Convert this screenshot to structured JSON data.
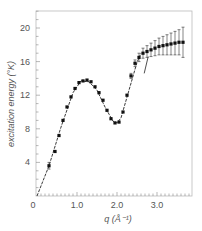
{
  "chart_data": {
    "type": "scatter",
    "title": "",
    "xlabel": "q (Å⁻¹)",
    "ylabel": "excitation energy (°K)",
    "xlim": [
      0,
      3.8
    ],
    "ylim": [
      0,
      22
    ],
    "x_ticks": [
      0,
      1.0,
      2.0,
      3.0
    ],
    "x_tick_labels": [
      "0",
      "1.0",
      "2.0",
      "3.0"
    ],
    "y_ticks": [
      4,
      8,
      12,
      16,
      20
    ],
    "y_tick_labels": [
      "4",
      "8",
      "12",
      "16",
      "20"
    ],
    "grid": false,
    "legend": null,
    "series": [
      {
        "name": "measured points",
        "marker": "square",
        "x": [
          0.3,
          0.45,
          0.55,
          0.65,
          0.75,
          0.85,
          0.95,
          1.05,
          1.15,
          1.25,
          1.35,
          1.45,
          1.55,
          1.65,
          1.75,
          1.85,
          1.95,
          2.05,
          2.15,
          2.25,
          2.35,
          2.45,
          2.55,
          2.65,
          2.75,
          2.85,
          2.95,
          3.05,
          3.15,
          3.25,
          3.35,
          3.45,
          3.55,
          3.65
        ],
        "y": [
          3.6,
          5.3,
          7.2,
          9.0,
          10.6,
          11.8,
          12.8,
          13.5,
          13.7,
          13.8,
          13.6,
          13.0,
          12.3,
          11.4,
          10.2,
          9.2,
          8.7,
          8.8,
          10.0,
          12.0,
          14.3,
          15.8,
          16.5,
          17.0,
          17.2,
          17.4,
          17.6,
          17.8,
          17.9,
          18.0,
          18.1,
          18.2,
          18.3,
          18.3
        ],
        "yerr": [
          0.4,
          0.2,
          0.2,
          0.2,
          0.2,
          0.2,
          0.2,
          0.2,
          0.2,
          0.2,
          0.2,
          0.2,
          0.2,
          0.2,
          0.2,
          0.2,
          0.2,
          0.2,
          0.2,
          0.2,
          0.3,
          0.4,
          0.5,
          0.6,
          0.7,
          0.8,
          0.9,
          1.0,
          1.1,
          1.2,
          1.3,
          1.4,
          1.5,
          1.8
        ]
      },
      {
        "name": "theoretical dispersion curve",
        "line": "dashed",
        "x": [
          0.0,
          0.3,
          0.6,
          0.9,
          1.1,
          1.3,
          1.5,
          1.7,
          1.9,
          2.0,
          2.1,
          2.3,
          2.5,
          2.6
        ],
        "y": [
          0.0,
          3.6,
          8.2,
          12.3,
          13.7,
          13.6,
          12.6,
          10.6,
          8.9,
          8.7,
          9.3,
          12.6,
          15.9,
          17.0
        ]
      }
    ],
    "annotations": [
      {
        "text": "short tick line near q≈2.7",
        "x": 2.72,
        "y": 14.8
      }
    ]
  }
}
